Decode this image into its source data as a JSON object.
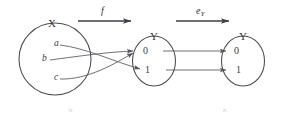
{
  "figure": {
    "type": "mathematical-mapping-diagram",
    "stroke_color": "#4a4a52",
    "text_color": "#3a3a42",
    "faint_mark_color": "#c2c2c8",
    "background": "#ffffff"
  },
  "sets": {
    "domain": {
      "name": "X",
      "elements": [
        {
          "label": "a"
        },
        {
          "label": "b"
        },
        {
          "label": "c"
        }
      ]
    },
    "codomain": {
      "name": "Y",
      "elements": [
        {
          "label": "0"
        },
        {
          "label": "1"
        }
      ]
    },
    "target": {
      "name": "Y",
      "elements": [
        {
          "label": "0"
        },
        {
          "label": "1"
        }
      ]
    }
  },
  "maps": {
    "first": {
      "label": "f",
      "subscript": "",
      "mappings": [
        {
          "from": "a",
          "to": "1"
        },
        {
          "from": "b",
          "to": "0"
        },
        {
          "from": "c",
          "to": "0"
        }
      ]
    },
    "second": {
      "label": "e",
      "subscript": "Y",
      "mappings": [
        {
          "from": "0",
          "to": "0"
        },
        {
          "from": "1",
          "to": "1"
        }
      ]
    }
  },
  "annotations": {
    "left_mark": "×",
    "right_mark": "×"
  }
}
